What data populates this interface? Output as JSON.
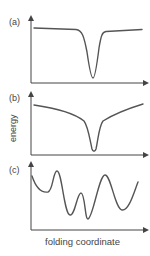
{
  "figure": {
    "panels": [
      {
        "label": "(a)",
        "description": "flat landscape with single narrow deep well"
      },
      {
        "label": "(b)",
        "description": "funnel-shaped landscape sloping toward single deep well"
      },
      {
        "label": "(c)",
        "description": "rugged landscape with multiple minima and barriers"
      }
    ],
    "ylabel": "energy",
    "xlabel": "folding coordinate",
    "colors": {
      "curve": "#555555",
      "axis": "#444444",
      "text": "#444444"
    }
  }
}
